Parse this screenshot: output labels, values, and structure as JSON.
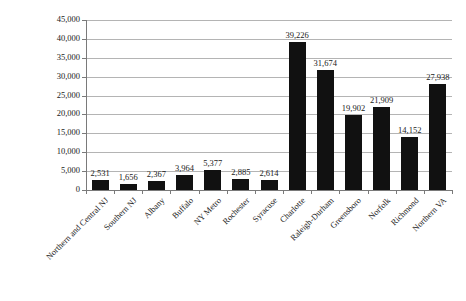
{
  "chart_data": {
    "type": "bar",
    "title": "",
    "subtitle": "",
    "xlabel": "",
    "ylabel": "",
    "ylim": [
      0,
      45000
    ],
    "grid": true,
    "legend": "none",
    "orientation": "vertical",
    "bar_color": "#111111",
    "gridline_color": "#b4b4b4",
    "axis_color": "#7a7a7a",
    "background_color": "#ffffff",
    "categories": [
      "Northern and Central NJ",
      "Southern NJ",
      "Albany",
      "Buffalo",
      "NY Metro",
      "Rochester",
      "Syracuse",
      "Charlotte",
      "Raleigh-Durham",
      "Greensboro",
      "Norfolk",
      "Richmond",
      "Northern VA"
    ],
    "values": [
      2531,
      1656,
      2367,
      3964,
      5377,
      2885,
      2614,
      39226,
      31674,
      19902,
      21909,
      14152,
      27938
    ],
    "value_labels": [
      "2,531",
      "1,656",
      "2,367",
      "3,964",
      "5,377",
      "2,885",
      "2,614",
      "39,226",
      "31,674",
      "19,902",
      "21,909",
      "14,152",
      "27,938"
    ],
    "yticks": [
      0,
      5000,
      10000,
      15000,
      20000,
      25000,
      30000,
      35000,
      40000,
      45000
    ],
    "ytick_labels": [
      "0",
      "5,000",
      "10,000",
      "15,000",
      "20,000",
      "25,000",
      "30,000",
      "35,000",
      "40,000",
      "45,000"
    ]
  }
}
